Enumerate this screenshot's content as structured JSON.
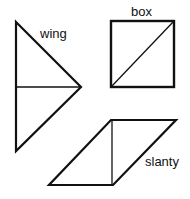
{
  "shapes": {
    "wing": {
      "label": "wing"
    },
    "box": {
      "label": "box"
    },
    "slanty": {
      "label": "slanty"
    }
  },
  "colors": {
    "stroke": "#111111",
    "background": "#ffffff"
  }
}
